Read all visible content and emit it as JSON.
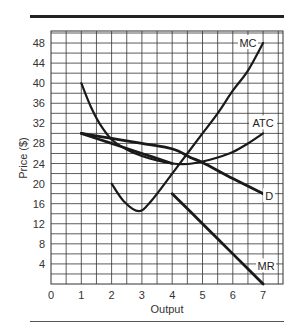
{
  "chart_data": {
    "type": "line",
    "title": "",
    "xlabel": "Output",
    "ylabel": "Price ($)",
    "xlim": [
      0,
      7.6
    ],
    "ylim": [
      0,
      50
    ],
    "grid": true,
    "x_ticks": [
      "0",
      "1",
      "2",
      "3",
      "4",
      "5",
      "6",
      "7"
    ],
    "y_ticks": [
      "4",
      "8",
      "12",
      "16",
      "20",
      "24",
      "28",
      "32",
      "36",
      "40",
      "44",
      "48"
    ],
    "series": [
      {
        "name": "MC",
        "label_pos": [
          6.5,
          48
        ],
        "points": [
          [
            2,
            20
          ],
          [
            2.4,
            16.5
          ],
          [
            2.9,
            14.5
          ],
          [
            3.3,
            16.5
          ],
          [
            4,
            22
          ],
          [
            4.5,
            26
          ],
          [
            5,
            30
          ],
          [
            5.5,
            34
          ],
          [
            6,
            38.5
          ],
          [
            6.5,
            42.5
          ],
          [
            7,
            48
          ]
        ]
      },
      {
        "name": "ATC",
        "label_pos": [
          7,
          32
        ],
        "points": [
          [
            1,
            40
          ],
          [
            1.3,
            35.5
          ],
          [
            1.6,
            32
          ],
          [
            2,
            28.8
          ],
          [
            2.5,
            26.8
          ],
          [
            3,
            25.5
          ],
          [
            3.5,
            24.6
          ],
          [
            4,
            24
          ],
          [
            4.5,
            23.9
          ],
          [
            5,
            24.4
          ],
          [
            5.5,
            25.2
          ],
          [
            6,
            26.3
          ],
          [
            6.5,
            28
          ],
          [
            7,
            30
          ]
        ]
      },
      {
        "name": "D",
        "label_pos": [
          7.2,
          17.5
        ],
        "points": [
          [
            1,
            30
          ],
          [
            2,
            29
          ],
          [
            3,
            28
          ],
          [
            3.8,
            27.2
          ],
          [
            4.2,
            26.5
          ],
          [
            4.6,
            25.2
          ],
          [
            5,
            24.2
          ],
          [
            6,
            21
          ],
          [
            7,
            18
          ]
        ]
      },
      {
        "name": "MR",
        "label_pos": [
          7.1,
          3.5
        ],
        "points": [
          [
            4,
            18
          ],
          [
            5,
            12
          ],
          [
            6,
            6
          ],
          [
            7,
            0
          ]
        ]
      },
      {
        "name": "MR (upper segment)",
        "points": [
          [
            1,
            30
          ],
          [
            2,
            28
          ],
          [
            3,
            26
          ],
          [
            4,
            24
          ]
        ]
      }
    ]
  }
}
